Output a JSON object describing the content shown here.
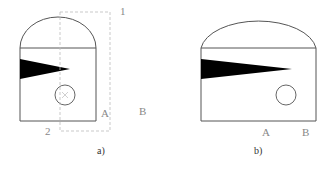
{
  "diagram": {
    "panel_a": {
      "caption": "a)",
      "labels": {
        "top_right": "1",
        "bottom_left": "2",
        "point_a": "A",
        "point_b": "B"
      },
      "elements": [
        "arched-outline",
        "black-wedge-short",
        "small-circle-with-x",
        "dashed-rectangle"
      ]
    },
    "panel_b": {
      "caption": "b)",
      "labels": {
        "point_a": "A",
        "point_b": "B"
      },
      "elements": [
        "arched-outline-wider",
        "black-wedge-long",
        "small-circle"
      ]
    },
    "colors": {
      "outline": "#555555",
      "fill": "#000000",
      "dashed": "#bbbbbb",
      "label": "#888888"
    }
  }
}
